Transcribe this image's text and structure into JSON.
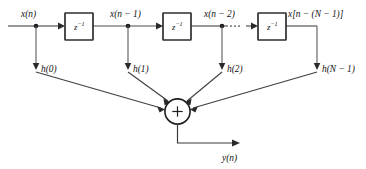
{
  "diagram": {
    "input_label": "x(n)",
    "output_label": "y(n)",
    "sum_symbol": "+",
    "ellipsis_label": "···",
    "delay_blocks": [
      {
        "id": "delay-1",
        "label_base": "z",
        "label_exp": "−1"
      },
      {
        "id": "delay-2",
        "label_base": "z",
        "label_exp": "−1"
      },
      {
        "id": "delay-3",
        "label_base": "z",
        "label_exp": "−1"
      }
    ],
    "signal_labels": [
      {
        "id": "signal-x-n",
        "text": "x(n)"
      },
      {
        "id": "signal-x-n-1",
        "text": "x(n − 1)"
      },
      {
        "id": "signal-x-n-2",
        "text": "x(n − 2)"
      },
      {
        "id": "signal-x-n-N-1",
        "text": "x[n − (N − 1)]"
      }
    ],
    "coefficient_labels": [
      {
        "id": "coeff-h0",
        "text": "h(0)"
      },
      {
        "id": "coeff-h1",
        "text": "h(1)"
      },
      {
        "id": "coeff-h2",
        "text": "h(2)"
      },
      {
        "id": "coeff-hN1",
        "text": "h(N − 1)"
      }
    ],
    "colors": {
      "background": "#ffffff",
      "wire": "#4d4d4d",
      "box_border": "#2e2e2e",
      "node": "#1c1c1c",
      "text": "#111111"
    }
  }
}
